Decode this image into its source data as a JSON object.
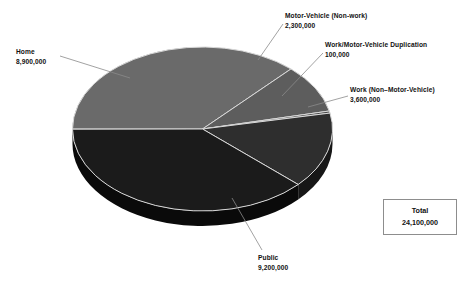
{
  "chart_data": {
    "type": "pie",
    "title": "",
    "subtitle": "",
    "xlabel": "",
    "ylabel": "",
    "legend_position": "none",
    "grid": false,
    "style": "3d-exploded-disc-grayscale",
    "total_label": "Total",
    "total_value": "24,100,000",
    "total_value_numeric": 24100000,
    "categories": [
      "Home",
      "Motor-Vehicle (Non-work)",
      "Work/Motor-Vehicle Duplication",
      "Work (Non–Motor-Vehicle)",
      "Public"
    ],
    "values": [
      8900000,
      2300000,
      100000,
      3600000,
      9200000
    ],
    "value_labels": [
      "8,900,000",
      "2,300,000",
      "100,000",
      "3,600,000",
      "9,200,000"
    ],
    "slices": [
      {
        "name": "Home",
        "label": "Home",
        "value": 8900000,
        "value_label": "8,900,000",
        "percent": 36.9,
        "color": "#6a6a6a",
        "side_color": "#3a3a3a",
        "start_angle": 180.0,
        "sweep_angle": 132.9
      },
      {
        "name": "Motor-Vehicle (Non-work)",
        "label": "Motor-Vehicle (Non-work)",
        "value": 2300000,
        "value_label": "2,300,000",
        "percent": 9.5,
        "color": "#5d5d5d",
        "side_color": "#2f2f2f",
        "start_angle": 312.9,
        "sweep_angle": 34.4
      },
      {
        "name": "Work/Motor-Vehicle Duplication",
        "label": "Work/Motor-Vehicle Duplication",
        "value": 100000,
        "value_label": "100,000",
        "percent": 0.4,
        "color": "#4a4a4a",
        "side_color": "#242424",
        "start_angle": 347.3,
        "sweep_angle": 1.5
      },
      {
        "name": "Work (Non–Motor-Vehicle)",
        "label": "Work (Non–Motor-Vehicle)",
        "value": 3600000,
        "value_label": "3,600,000",
        "percent": 14.9,
        "color": "#2e2e2e",
        "side_color": "#171717",
        "start_angle": 348.8,
        "sweep_angle": 53.8
      },
      {
        "name": "Public",
        "label": "Public",
        "value": 9200000,
        "value_label": "9,200,000",
        "percent": 38.2,
        "color": "#1b1b1b",
        "side_color": "#0a0a0a",
        "start_angle": 42.6,
        "sweep_angle": 137.3
      }
    ]
  },
  "labels": {
    "home": {
      "name": "Home",
      "value": "8,900,000"
    },
    "motor_vehicle": {
      "name": "Motor-Vehicle (Non-work)",
      "value": "2,300,000"
    },
    "duplication": {
      "name": "Work/Motor-Vehicle Duplication",
      "value": "100,000"
    },
    "work": {
      "name": "Work (Non–Motor-Vehicle)",
      "value": "3,600,000"
    },
    "public": {
      "name": "Public",
      "value": "9,200,000"
    }
  },
  "total_box": {
    "title": "Total",
    "value": "24,100,000"
  },
  "colors": {
    "background": "#ffffff",
    "text": "#111111",
    "leader_line": "#8a8a8a",
    "box_border": "#8d8d8d",
    "slice_divider": "#d8d8d8"
  }
}
